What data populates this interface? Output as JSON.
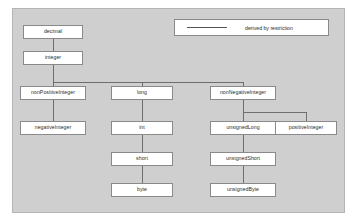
{
  "diagram": {
    "panel_color": "#cfcfcf",
    "box_fill": "#ffffff",
    "line_color": "#6e6e6e",
    "legend": {
      "line_style": "solid",
      "label": "derived by restriction"
    },
    "nodes": [
      {
        "id": "decimal",
        "label": "decimal",
        "x": 22,
        "y": 24,
        "w": 60,
        "h": 14
      },
      {
        "id": "integer",
        "label": "integer",
        "x": 22,
        "y": 50,
        "w": 60,
        "h": 14
      },
      {
        "id": "nonPositiveInteger",
        "label": "nonPositiveInteger",
        "x": 19,
        "y": 85,
        "w": 66,
        "h": 14
      },
      {
        "id": "long",
        "label": "long",
        "x": 110,
        "y": 85,
        "w": 62,
        "h": 14
      },
      {
        "id": "nonNegativeInteger",
        "label": "nonNegativeInteger",
        "x": 189,
        "y": 85,
        "w": 66,
        "h": 14
      },
      {
        "id": "negativeInteger",
        "label": "negativeInteger",
        "x": 19,
        "y": 120,
        "w": 66,
        "h": 14
      },
      {
        "id": "int",
        "label": "int",
        "x": 110,
        "y": 120,
        "w": 62,
        "h": 14
      },
      {
        "id": "unsignedLong",
        "label": "unsignedLong",
        "x": 189,
        "y": 120,
        "w": 66,
        "h": 14
      },
      {
        "id": "positiveInteger",
        "label": "positiveInteger",
        "x": 274,
        "y": 120,
        "w": 62,
        "h": 14
      },
      {
        "id": "short",
        "label": "short",
        "x": 110,
        "y": 151,
        "w": 62,
        "h": 14
      },
      {
        "id": "unsignedShort",
        "label": "unsignedShort",
        "x": 189,
        "y": 151,
        "w": 66,
        "h": 14
      },
      {
        "id": "byte",
        "label": "byte",
        "x": 110,
        "y": 182,
        "w": 62,
        "h": 14
      },
      {
        "id": "unsignedByte",
        "label": "unsignedByte",
        "x": 189,
        "y": 182,
        "w": 66,
        "h": 14
      }
    ],
    "edges": [
      {
        "from": "decimal",
        "to": "integer",
        "kind": "derived by restriction"
      },
      {
        "from": "integer",
        "to": "nonPositiveInteger",
        "kind": "derived by restriction"
      },
      {
        "from": "integer",
        "to": "long",
        "kind": "derived by restriction"
      },
      {
        "from": "integer",
        "to": "nonNegativeInteger",
        "kind": "derived by restriction"
      },
      {
        "from": "nonPositiveInteger",
        "to": "negativeInteger",
        "kind": "derived by restriction"
      },
      {
        "from": "long",
        "to": "int",
        "kind": "derived by restriction"
      },
      {
        "from": "int",
        "to": "short",
        "kind": "derived by restriction"
      },
      {
        "from": "short",
        "to": "byte",
        "kind": "derived by restriction"
      },
      {
        "from": "nonNegativeInteger",
        "to": "unsignedLong",
        "kind": "derived by restriction"
      },
      {
        "from": "nonNegativeInteger",
        "to": "positiveInteger",
        "kind": "derived by restriction"
      },
      {
        "from": "unsignedLong",
        "to": "unsignedShort",
        "kind": "derived by restriction"
      },
      {
        "from": "unsignedShort",
        "to": "unsignedByte",
        "kind": "derived by restriction"
      }
    ]
  }
}
